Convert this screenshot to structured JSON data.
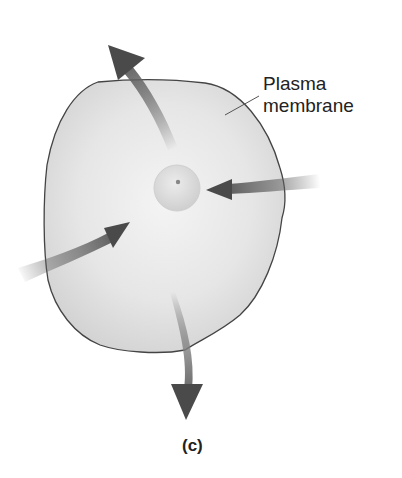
{
  "figure": {
    "panel_caption": "(c)",
    "labels": {
      "plasma_membrane_line1": "Plasma",
      "plasma_membrane_line2": "membrane"
    },
    "elements": {
      "cell": "irregular rounded cell with plasma membrane outline",
      "nucleus": "small central sphere with a dark dot",
      "arrows": [
        {
          "name": "arrow-out-top",
          "direction": "outward, up-left"
        },
        {
          "name": "arrow-in-right",
          "direction": "inward, from right"
        },
        {
          "name": "arrow-in-left",
          "direction": "inward, from lower-left"
        },
        {
          "name": "arrow-out-bottom",
          "direction": "outward, down"
        }
      ]
    },
    "colors": {
      "cell_fill": "#e4e4e4",
      "cell_outline": "#444444",
      "arrow_dark": "#4a4a4a",
      "nucleus_fill": "#d8d8d8"
    }
  }
}
